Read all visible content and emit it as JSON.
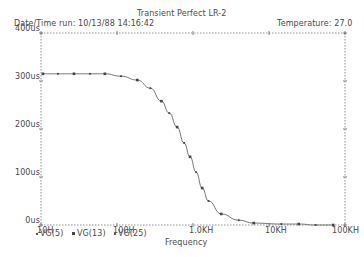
{
  "header": {
    "title": "Transient Perfect LR-2",
    "datetime_label": "Date/Time run: 10/13/88  14:16:42",
    "temperature_label": "Temperature:  27.0"
  },
  "legend": [
    {
      "label": "VG(5)",
      "marker": "dot"
    },
    {
      "label": "VG(13)",
      "marker": "square"
    },
    {
      "label": "VG(25)",
      "marker": "dot"
    }
  ],
  "chart_data": {
    "type": "line",
    "title": "Transient Perfect LR-2",
    "xlabel": "Frequency",
    "ylabel": "",
    "xscale": "log",
    "xlim": [
      10,
      100000
    ],
    "ylim": [
      0,
      400
    ],
    "y_unit": "us",
    "x_ticks": [
      "10H",
      "100H",
      "1.0KH",
      "10KH",
      "100KH"
    ],
    "y_ticks": [
      "0us",
      "100us",
      "200us",
      "300us",
      "400us"
    ],
    "grid": false,
    "legend_position": "bottom-left",
    "series": [
      {
        "name": "VG(13)",
        "x": [
          10.6,
          16.7,
          27.2,
          44.2,
          69.3,
          113,
          185,
          275,
          384,
          488,
          618,
          763,
          915,
          1100,
          1320,
          1600,
          2350,
          4000,
          6300,
          14500,
          24600,
          41000,
          70000
        ],
        "values": [
          315,
          315,
          315,
          315,
          315,
          310,
          302,
          285,
          258,
          233,
          204,
          171,
          142,
          110,
          77,
          50,
          23,
          10,
          4,
          2,
          2,
          0,
          0
        ]
      }
    ]
  },
  "axes": {
    "x_ticks": [
      "10H",
      "100H",
      "1.0KH",
      "10KH",
      "100KH"
    ],
    "y_ticks": [
      "0us",
      "100us",
      "200us",
      "300us",
      "400us"
    ],
    "xlabel": "Frequency"
  }
}
